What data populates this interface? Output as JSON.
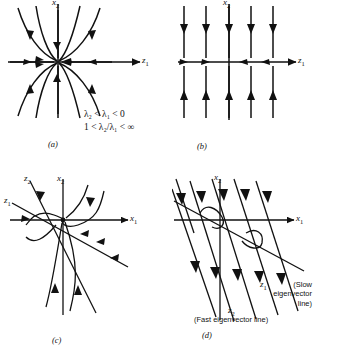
{
  "figure": {
    "panels": [
      {
        "id": "a",
        "letter": "(a)",
        "axis_x_label": "z",
        "axis_x_sub": "1",
        "axis_y_label": "x",
        "axis_y_sub": "2",
        "description": "stable node in eigenvector coordinates"
      },
      {
        "id": "b",
        "letter": "(b)",
        "axis_x_label": "z",
        "axis_x_sub": "1",
        "axis_y_label": "x",
        "axis_y_sub": "2",
        "description": "degenerate straight-line trajectories"
      },
      {
        "id": "c",
        "letter": "(c)",
        "axis_x_label": "x",
        "axis_x_sub": "1",
        "axis_y_label": "x",
        "axis_y_sub": "2",
        "eigen_label_1": "z",
        "eigen_sub_1": "1",
        "eigen_label_2": "z",
        "eigen_sub_2": "2",
        "description": "stable node in original coordinates"
      },
      {
        "id": "d",
        "letter": "(d)",
        "axis_x_label": "x",
        "axis_x_sub": "1",
        "axis_y_label": "x",
        "axis_y_sub": "2",
        "eigen_label_1": "z",
        "eigen_sub_1": "1",
        "eigen_label_2": "z",
        "eigen_sub_2": "2",
        "slow_note_line1": "(Slow",
        "slow_note_line2": "eigenvector",
        "slow_note_line3": "line)",
        "fast_note": "(Fast eigenvector line)",
        "description": "near-degenerate node with fast and slow eigenvector lines"
      }
    ],
    "conditions": {
      "line1": "λ₂ < λ₁ < 0",
      "line2": "1 < λ₂/λ₁ < ∞"
    },
    "colors": {
      "stroke": "#111111",
      "background": "#ffffff"
    }
  }
}
